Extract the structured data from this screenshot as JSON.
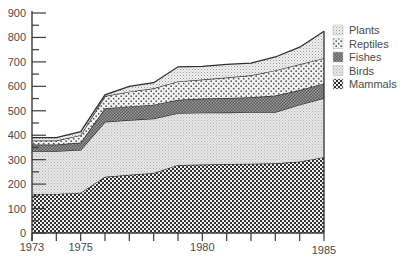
{
  "chart_data": {
    "type": "area",
    "stacked": true,
    "title": "",
    "xlabel": "",
    "ylabel": "",
    "x": [
      1973,
      1974,
      1975,
      1976,
      1977,
      1978,
      1979,
      1980,
      1981,
      1982,
      1983,
      1984,
      1985
    ],
    "x_tick_labels": [
      "1973",
      "1975",
      "1980",
      "1985"
    ],
    "x_labeled_ticks": [
      1973,
      1975,
      1980,
      1985
    ],
    "ylim": [
      0,
      900
    ],
    "y_ticks": [
      0,
      100,
      200,
      300,
      400,
      500,
      600,
      700,
      800,
      900
    ],
    "y_minor_step": 50,
    "grid": false,
    "legend_position": "right",
    "series": [
      {
        "name": "Mammals",
        "pattern": "large-checker",
        "values": [
          160,
          160,
          165,
          230,
          238,
          245,
          278,
          280,
          282,
          283,
          285,
          292,
          310
        ]
      },
      {
        "name": "Birds",
        "pattern": "fine-light-dots",
        "values": [
          175,
          175,
          175,
          225,
          224,
          223,
          212,
          212,
          211,
          211,
          210,
          233,
          242
        ]
      },
      {
        "name": "Fishes",
        "pattern": "dark-checker",
        "values": [
          27,
          27,
          30,
          55,
          56,
          57,
          55,
          58,
          59,
          61,
          67,
          60,
          60
        ]
      },
      {
        "name": "Reptiles",
        "pattern": "sparse-dots",
        "values": [
          16,
          16,
          30,
          50,
          60,
          67,
          75,
          78,
          84,
          90,
          103,
          105,
          103
        ]
      },
      {
        "name": "Plants",
        "pattern": "light-stipple",
        "values": [
          12,
          12,
          15,
          5,
          22,
          23,
          60,
          54,
          54,
          50,
          55,
          70,
          110
        ]
      }
    ],
    "legend": [
      "Plants",
      "Reptiles",
      "Fishes",
      "Birds",
      "Mammals"
    ]
  },
  "colors": {
    "axis": "#3a3a3a",
    "outline": "#2e2e2e",
    "text": "#4a4a4a"
  }
}
